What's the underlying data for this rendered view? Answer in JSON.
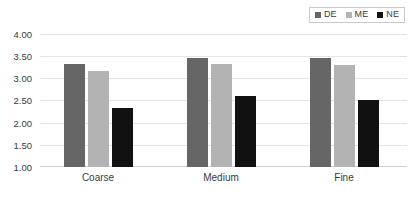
{
  "chart_data": {
    "type": "bar",
    "title": "",
    "subtitle": "",
    "xlabel": "",
    "ylabel": "",
    "categories": [
      "Coarse",
      "Medium",
      "Fine"
    ],
    "series": [
      {
        "name": "DE",
        "color": "#666666",
        "values": [
          3.32,
          3.47,
          3.45
        ]
      },
      {
        "name": "ME",
        "color": "#b3b3b3",
        "values": [
          3.17,
          3.33,
          3.3
        ]
      },
      {
        "name": "NE",
        "color": "#111111",
        "values": [
          2.33,
          2.61,
          2.51
        ]
      }
    ],
    "ylim": [
      1.0,
      4.0
    ],
    "ytick_step": 0.5,
    "ytick_labels": [
      "4.00",
      "3.50",
      "3.00",
      "2.50",
      "2.00",
      "1.50",
      "1.00"
    ],
    "ytick_values": [
      4.0,
      3.5,
      3.0,
      2.5,
      2.0,
      1.5,
      1.0
    ],
    "grid": true,
    "grid_axis": "y",
    "legend_position": "top-right",
    "legend_orientation": "horizontal",
    "legend_entries": [
      "DE",
      "ME",
      "NE"
    ],
    "background_color": "#ffffff",
    "grid_color": "#e3e3e3",
    "text_color": "#3a3a3a"
  }
}
